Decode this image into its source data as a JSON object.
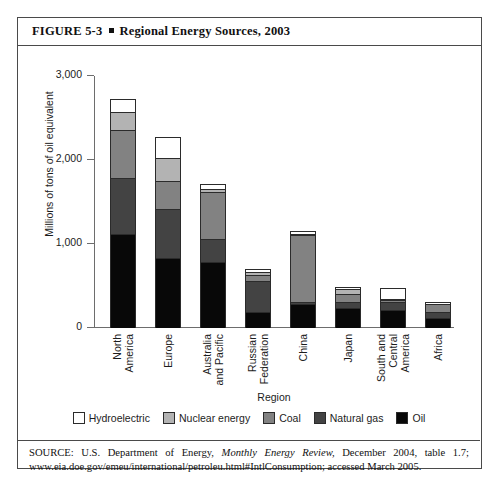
{
  "figure": {
    "number": "FIGURE 5-3",
    "bullet": "▪",
    "title": "Regional Energy Sources, 2003"
  },
  "source": {
    "prefix": "SOURCE: U.S. Department of Energy,",
    "italic": "Monthly Energy Review,",
    "rest": "December 2004, table 1.7; www.eia.doe.gov/emeu/international/petroleu.html#IntlConsumption; accessed March 2005."
  },
  "colors": {
    "hydroelectric": "#ffffff",
    "nuclear": "#b3b3b3",
    "coal": "#828282",
    "natural_gas": "#434343",
    "oil": "#080808",
    "axis": "#6d6d6d",
    "border": "#4a4a4a",
    "text": "#1c1c1c"
  },
  "chart_data": {
    "type": "bar",
    "subtype": "stacked-vertical",
    "title": "Regional Energy Sources, 2003",
    "xlabel": "Region",
    "ylabel": "Millions of tons of oil equivalent",
    "ylim": [
      0,
      3000
    ],
    "yticks": [
      0,
      1000,
      2000,
      3000
    ],
    "ytick_labels": [
      "0",
      "1,000",
      "2,000",
      "3,000"
    ],
    "grid": false,
    "legend_position": "bottom",
    "stack_order_bottom_to_top": [
      "Oil",
      "Natural gas",
      "Coal",
      "Nuclear energy",
      "Hydroelectric"
    ],
    "categories": [
      "North America",
      "Europe",
      "Australia and Pacific",
      "Russian Federation",
      "China",
      "Japan",
      "South and Central America",
      "Africa"
    ],
    "category_lines": [
      [
        "North",
        "America"
      ],
      [
        "Europe",
        ""
      ],
      [
        "Australia",
        "and Pacific"
      ],
      [
        "Russian",
        "Federation"
      ],
      [
        "China",
        ""
      ],
      [
        "Japan",
        ""
      ],
      [
        "South and",
        "Central",
        "America"
      ],
      [
        "Africa",
        ""
      ]
    ],
    "series": [
      {
        "name": "Oil",
        "color": "#080808",
        "values": [
          1120,
          830,
          790,
          185,
          280,
          240,
          215,
          125
        ]
      },
      {
        "name": "Natural gas",
        "color": "#434343",
        "values": [
          660,
          590,
          265,
          375,
          35,
          70,
          95,
          65
        ]
      },
      {
        "name": "Coal",
        "color": "#828282",
        "values": [
          580,
          335,
          560,
          70,
          790,
          95,
          20,
          95
        ]
      },
      {
        "name": "Nuclear energy",
        "color": "#b3b3b3",
        "values": [
          215,
          265,
          35,
          35,
          10,
          55,
          10,
          5
        ]
      },
      {
        "name": "Hydroelectric",
        "color": "#ffffff",
        "values": [
          150,
          250,
          60,
          40,
          35,
          25,
          140,
          25
        ]
      }
    ],
    "totals": [
      2725,
      2270,
      1710,
      705,
      1150,
      485,
      480,
      315
    ]
  },
  "legend": [
    {
      "label": "Hydroelectric",
      "color": "#ffffff"
    },
    {
      "label": "Nuclear energy",
      "color": "#b3b3b3"
    },
    {
      "label": "Coal",
      "color": "#828282"
    },
    {
      "label": "Natural gas",
      "color": "#434343"
    },
    {
      "label": "Oil",
      "color": "#080808"
    }
  ]
}
